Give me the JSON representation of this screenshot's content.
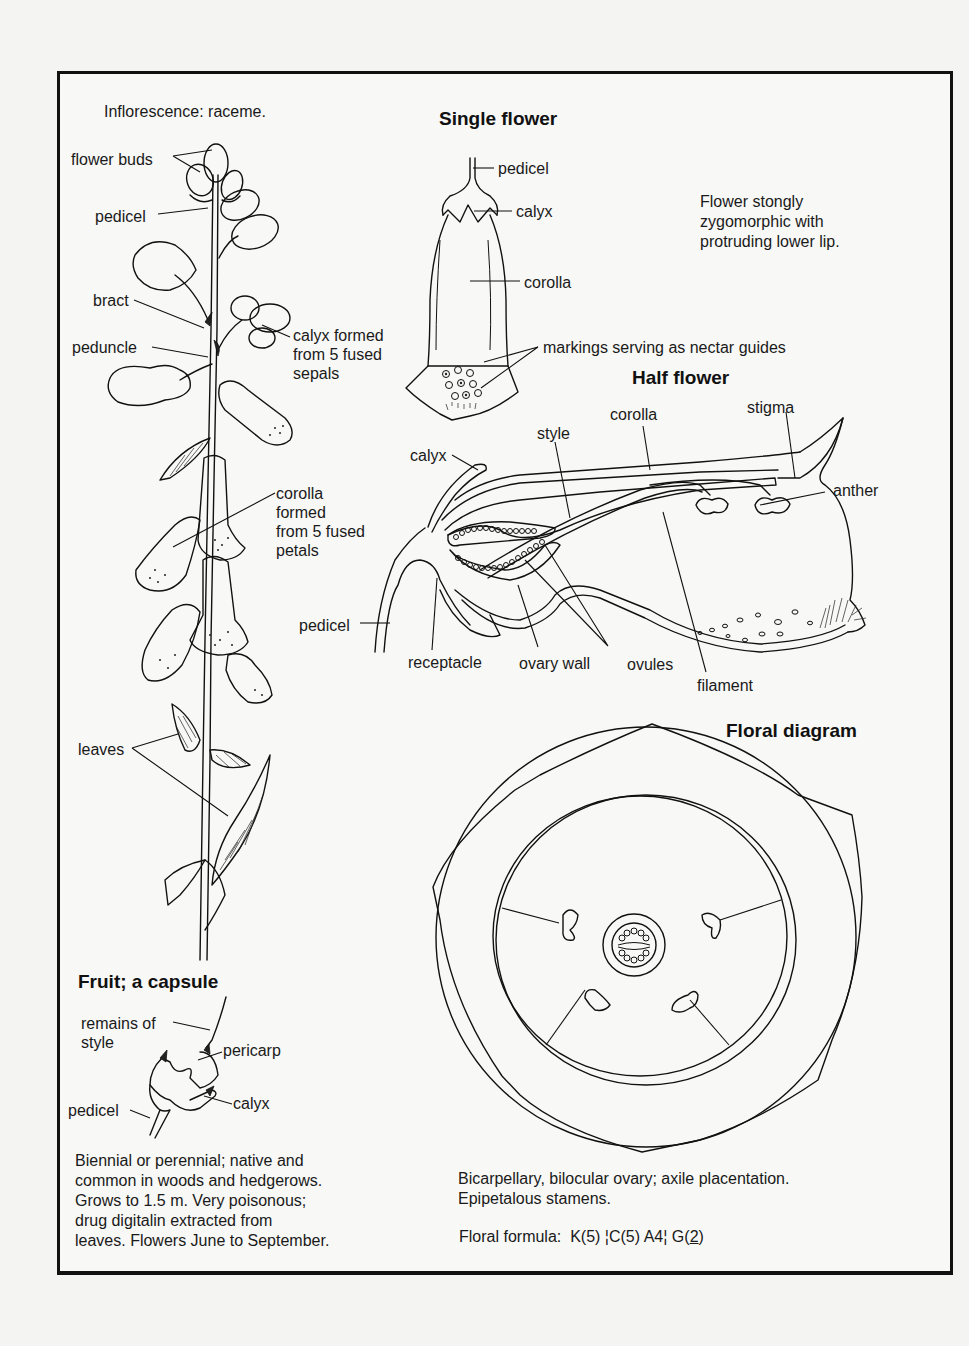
{
  "left_panel": {
    "inflorescence_note": "Inflorescence: raceme.",
    "labels": {
      "flower_buds": "flower buds",
      "pedicel": "pedicel",
      "bract": "bract",
      "peduncle": "peduncle",
      "calyx": "calyx formed\nfrom 5 fused\nsepals",
      "corolla": "corolla\nformed\nfrom 5 fused\npetals",
      "leaves": "leaves"
    }
  },
  "single_flower": {
    "title": "Single flower",
    "labels": {
      "pedicel": "pedicel",
      "calyx": "calyx",
      "corolla": "corolla",
      "markings": "markings serving as nectar guides"
    },
    "note": "Flower stongly\nzygomorphic with\nprotruding lower lip."
  },
  "half_flower": {
    "title": "Half flower",
    "labels": {
      "corolla": "corolla",
      "stigma": "stigma",
      "style": "style",
      "calyx": "calyx",
      "anther": "anther",
      "pedicel": "pedicel",
      "receptacle": "receptacle",
      "ovary_wall": "ovary wall",
      "ovules": "ovules",
      "filament": "filament"
    }
  },
  "floral_diagram": {
    "title": "Floral diagram",
    "description": "Bicarpellary, bilocular ovary; axile placentation.\nEpipetalous stamens.",
    "formula_label": "Floral formula:",
    "formula": {
      "calyx": "K(5)",
      "corolla_androecium_open": "¦C(5) A4¦",
      "gynoecium_prefix": "G(",
      "gynoecium_count": "2",
      "gynoecium_suffix": ")"
    }
  },
  "fruit": {
    "title": "Fruit; a capsule",
    "labels": {
      "remains_of_style": "remains of\nstyle",
      "pericarp": "pericarp",
      "calyx": "calyx",
      "pedicel": "pedicel"
    },
    "description": "Biennial or perennial; native and\ncommon in woods and hedgerows.\nGrows to 1.5 m. Very poisonous;\ndrug digitalin extracted from\nleaves. Flowers June to September."
  }
}
